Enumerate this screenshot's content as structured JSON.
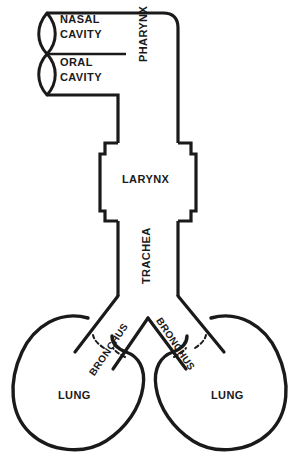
{
  "figure": {
    "type": "anatomical-line-diagram",
    "background_color": "#ffffff",
    "stroke_color": "#1a1a1a",
    "width": 299,
    "height": 461
  },
  "labels": {
    "nasal_cavity": "NASAL\nCAVITY",
    "oral_cavity": "ORAL\nCAVITY",
    "pharynx": "PHARYNX",
    "larynx": "LARYNX",
    "trachea": "TRACHEA",
    "bronchus_left": "BRONCHUS",
    "bronchus_right": "BRONCHUS",
    "lung_left": "LUNG",
    "lung_right": "LUNG"
  },
  "parts": [
    {
      "name": "nasal-cavity",
      "label": "NASAL CAVITY",
      "shape": "lens-ellipse",
      "side": "upper-left"
    },
    {
      "name": "oral-cavity",
      "label": "ORAL CAVITY",
      "shape": "lens-ellipse",
      "side": "lower-left"
    },
    {
      "name": "pharynx",
      "label": "PHARYNX",
      "shape": "vertical-tube",
      "orientation": "vertical"
    },
    {
      "name": "larynx",
      "label": "LARYNX",
      "shape": "notched-box",
      "orientation": "vertical"
    },
    {
      "name": "trachea",
      "label": "TRACHEA",
      "shape": "vertical-tube",
      "orientation": "vertical"
    },
    {
      "name": "bronchus-left",
      "label": "BRONCHUS",
      "shape": "branch-line",
      "side": "left"
    },
    {
      "name": "bronchus-right",
      "label": "BRONCHUS",
      "shape": "branch-line",
      "side": "right"
    },
    {
      "name": "lung-left",
      "label": "LUNG",
      "shape": "kidney-bean",
      "side": "left"
    },
    {
      "name": "lung-right",
      "label": "LUNG",
      "shape": "kidney-bean",
      "side": "right"
    }
  ]
}
